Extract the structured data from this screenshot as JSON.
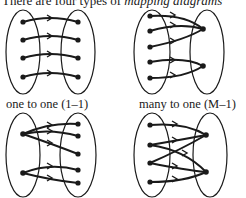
{
  "intro": {
    "text": "There are four types of ",
    "emphasis": "mapping diagrams"
  },
  "colors": {
    "ink": "#1a1a1a",
    "background": "#ffffff"
  },
  "diagrams": [
    {
      "id": "one-to-one",
      "label": "one to one (1–1)",
      "domain_points": 4,
      "range_points": 4,
      "mappings": [
        [
          0,
          0
        ],
        [
          1,
          1
        ],
        [
          2,
          2
        ],
        [
          3,
          3
        ]
      ]
    },
    {
      "id": "many-to-one",
      "label": "many to one (M–1)",
      "domain_points": 5,
      "range_points": 2,
      "mappings": [
        [
          0,
          0
        ],
        [
          1,
          0
        ],
        [
          2,
          0
        ],
        [
          3,
          1
        ],
        [
          4,
          1
        ]
      ]
    },
    {
      "id": "one-to-many",
      "label": "",
      "domain_points": 2,
      "range_points": 5,
      "mappings": [
        [
          0,
          0
        ],
        [
          0,
          1
        ],
        [
          0,
          2
        ],
        [
          1,
          3
        ],
        [
          1,
          4
        ]
      ]
    },
    {
      "id": "many-to-many",
      "label": "",
      "domain_points": 4,
      "range_points": 2,
      "mappings": [
        [
          0,
          0
        ],
        [
          1,
          0
        ],
        [
          1,
          1
        ],
        [
          2,
          0
        ],
        [
          2,
          1
        ],
        [
          3,
          1
        ]
      ]
    }
  ]
}
